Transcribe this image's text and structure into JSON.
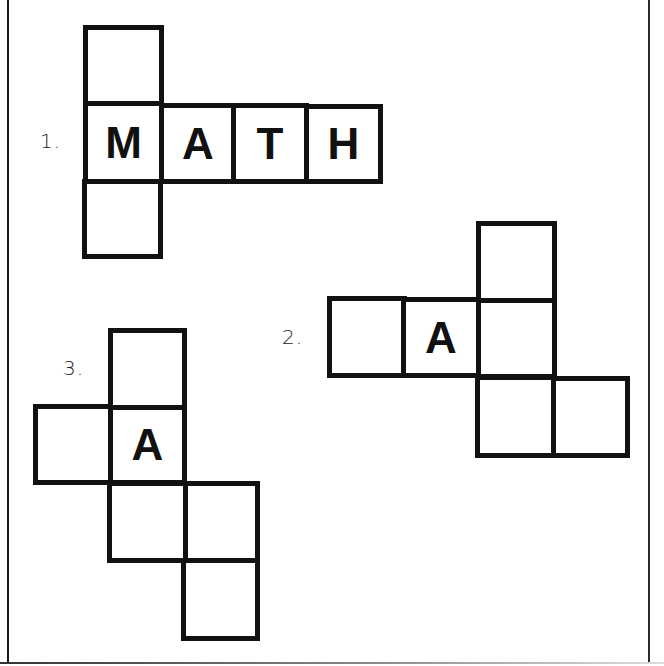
{
  "nets": [
    {
      "label": "1.",
      "cells": [
        {
          "letter": ""
        },
        {
          "letter": "M"
        },
        {
          "letter": "A"
        },
        {
          "letter": "T"
        },
        {
          "letter": "H"
        },
        {
          "letter": ""
        }
      ]
    },
    {
      "label": "2.",
      "cells": [
        {
          "letter": ""
        },
        {
          "letter": ""
        },
        {
          "letter": "A"
        },
        {
          "letter": ""
        },
        {
          "letter": ""
        },
        {
          "letter": ""
        }
      ]
    },
    {
      "label": "3.",
      "cells": [
        {
          "letter": ""
        },
        {
          "letter": ""
        },
        {
          "letter": "A"
        },
        {
          "letter": ""
        },
        {
          "letter": ""
        },
        {
          "letter": ""
        }
      ]
    }
  ]
}
